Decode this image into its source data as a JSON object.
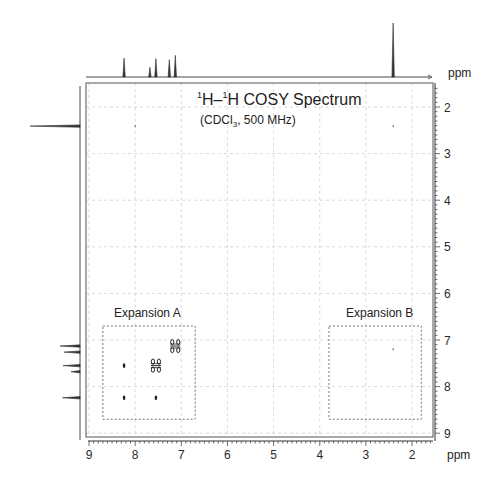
{
  "chart_data": {
    "type": "heatmap",
    "subtype": "2D NMR COSY contour plot",
    "title": "1H–1H COSY Spectrum",
    "title_parts": {
      "sup1": "1",
      "a": "H–",
      "sup2": "1",
      "b": "H COSY Spectrum"
    },
    "subtitle": "(CDCl3, 500 MHz)",
    "subtitle_parts": {
      "a": "(CDCl",
      "sub": "3",
      "b": ", 500 MHz)"
    },
    "xlabel": "ppm",
    "ylabel": "ppm",
    "top_axis_label": "ppm",
    "xlim": [
      9,
      1.6
    ],
    "ylim": [
      1.6,
      9
    ],
    "x_ticks": [
      9,
      8,
      7,
      6,
      5,
      4,
      3,
      2
    ],
    "y_ticks": [
      2,
      3,
      4,
      5,
      6,
      7,
      8,
      9
    ],
    "grid": "dashed, every 1 ppm",
    "projection_1d": {
      "peaks": [
        {
          "ppm": 8.24,
          "height": 0.35
        },
        {
          "ppm": 7.68,
          "height": 0.18
        },
        {
          "ppm": 7.55,
          "height": 0.34
        },
        {
          "ppm": 7.26,
          "height": 0.32
        },
        {
          "ppm": 7.13,
          "height": 0.4
        },
        {
          "ppm": 2.41,
          "height": 1.0
        }
      ]
    },
    "cross_peaks": [
      {
        "x": 7.13,
        "y": 7.13,
        "size": "large",
        "type": "diagonal"
      },
      {
        "x": 7.55,
        "y": 7.55,
        "size": "large",
        "type": "diagonal"
      },
      {
        "x": 8.24,
        "y": 7.55,
        "size": "small",
        "type": "off-diagonal"
      },
      {
        "x": 8.24,
        "y": 8.24,
        "size": "small",
        "type": "diagonal"
      },
      {
        "x": 7.55,
        "y": 8.24,
        "size": "small",
        "type": "off-diagonal"
      },
      {
        "x": 2.41,
        "y": 2.41,
        "size": "tiny",
        "type": "diagonal"
      },
      {
        "x": 8.0,
        "y": 2.41,
        "size": "tiny",
        "type": "artifact"
      },
      {
        "x": 2.41,
        "y": 7.2,
        "size": "tiny",
        "type": "artifact"
      }
    ],
    "annotations": [
      {
        "label": "Expansion A",
        "box": {
          "x_ppm": [
            8.7,
            6.7
          ],
          "y_ppm": [
            6.7,
            8.7
          ]
        }
      },
      {
        "label": "Expansion B",
        "box": {
          "x_ppm": [
            3.8,
            1.8
          ],
          "y_ppm": [
            6.7,
            8.7
          ]
        }
      }
    ]
  },
  "labels": {
    "ppm_top": "ppm",
    "ppm_right": "ppm",
    "ppm_bottom": "ppm",
    "expansion_a": "Expansion A",
    "expansion_b": "Expansion B"
  },
  "colors": {
    "line": "#333333",
    "grid": "#d0d0d0",
    "frame": "#555555",
    "box": "#666666"
  }
}
